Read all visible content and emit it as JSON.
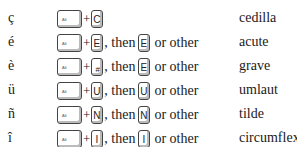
{
  "rows": [
    {
      "char": "ç",
      "modifier": "Alt",
      "key": "C",
      "key_sup": "",
      "then": "",
      "then_key": "",
      "or_other": "",
      "description": "cedilla"
    },
    {
      "char": "é",
      "modifier": "Alt",
      "key": "E",
      "key_sup": "",
      "then": ", then",
      "then_key": "E",
      "or_other": "or other",
      "description": "acute"
    },
    {
      "char": "è",
      "modifier": "Alt",
      "key": "#",
      "key_sup": "¯",
      "then": ", then",
      "then_key": "E",
      "or_other": "or other",
      "description": "grave"
    },
    {
      "char": "ü",
      "modifier": "Alt",
      "key": "U",
      "key_sup": "",
      "then": ", then",
      "then_key": "U",
      "or_other": "or other",
      "description": "umlaut"
    },
    {
      "char": "ñ",
      "modifier": "Alt",
      "key": "N",
      "key_sup": "",
      "then": ", then",
      "then_key": "N",
      "or_other": "or other",
      "description": "tilde"
    },
    {
      "char": "î",
      "modifier": "Alt",
      "key": "I",
      "key_sup": "",
      "then": ", then",
      "then_key": "I",
      "or_other": "or other",
      "description": "circumflex"
    }
  ],
  "plus": "+"
}
